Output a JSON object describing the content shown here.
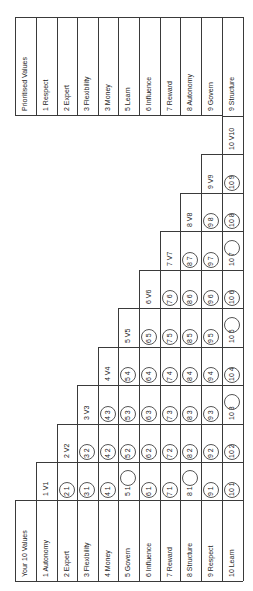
{
  "prioritised": {
    "header": "Prioritised Values",
    "items": [
      "1 Respect",
      "2 Expert",
      "3 Flexibility",
      "3 Money",
      "5 Learn",
      "6 Influence",
      "7 Reward",
      "8 Autonomy",
      "9 Govern",
      "9 Structure"
    ]
  },
  "values": {
    "header": "Your 10 Values",
    "items": [
      "1 Autonomy",
      "2 Expert",
      "3 Flexibility",
      "4 Money",
      "5 Govern",
      "6 Influence",
      "7 Reward",
      "8 Structure",
      "9 Respect",
      "10 Learn"
    ]
  },
  "matrix": {
    "columns": [
      "V1",
      "V2",
      "V3",
      "V4",
      "V5",
      "V6",
      "V7",
      "V8",
      "V9",
      "V10"
    ],
    "circled": {
      "V1": {
        "2": "2",
        "3": "3",
        "4": "4",
        "5": "1",
        "6": "6",
        "7": "7",
        "8": "1",
        "9": "9",
        "10": "10"
      },
      "V2": {
        "3": "3",
        "4": "4",
        "5": "5",
        "6": "6",
        "7": "7",
        "8": "8",
        "9": "9",
        "10": "10"
      },
      "V3": {
        "4": "4",
        "5": "5",
        "6": "6",
        "7": "7",
        "8": "8",
        "9": "9",
        "10": "3"
      },
      "V4": {
        "5": "5",
        "6": "6",
        "7": "7",
        "8": "8",
        "9": "9",
        "10": "10"
      },
      "V5": {
        "6": "6",
        "7": "7",
        "8": "8",
        "9": "9",
        "10": "5"
      },
      "V6": {
        "7": "7",
        "8": "8",
        "9": "9",
        "10": "10"
      },
      "V7": {
        "8": "8",
        "9": "9",
        "10": "7"
      },
      "V8": {
        "9": "9",
        "10": "10"
      },
      "V9": {
        "10": "10"
      }
    }
  }
}
